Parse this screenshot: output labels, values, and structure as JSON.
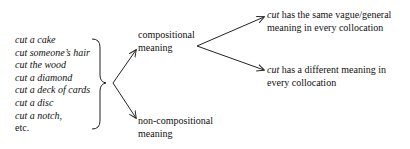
{
  "examples": {
    "items": [
      {
        "text": "cut a cake",
        "italic": true
      },
      {
        "text": "cut someone’s hair",
        "italic": true
      },
      {
        "text": "cut the wood",
        "italic": true
      },
      {
        "text": "cut a diamond",
        "italic": true
      },
      {
        "text": "cut a deck of cards",
        "italic": true
      },
      {
        "text": "cut a disc",
        "italic": true
      },
      {
        "text": "cut a notch,",
        "italic": true
      },
      {
        "text": "etc.",
        "italic": false
      }
    ]
  },
  "branches": {
    "compositional": {
      "line1": "compositional",
      "line2": "meaning"
    },
    "non_compositional": {
      "line1": "non-compositional",
      "line2": "meaning"
    }
  },
  "sub_branches": {
    "same": {
      "word": "cut",
      "line1_rest": " has the same vague/general",
      "line2": "meaning in every collocation"
    },
    "different": {
      "word": "cut",
      "line1_rest": " has a different meaning in",
      "line2": "every collocation"
    }
  }
}
